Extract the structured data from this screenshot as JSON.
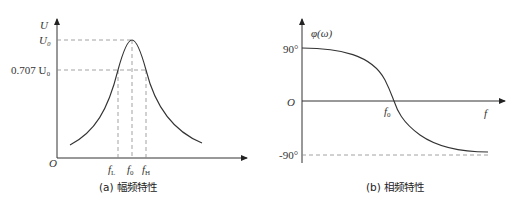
{
  "figure": {
    "panel_a": {
      "caption": "(a) 幅频特性",
      "y_axis_label": "U",
      "origin_label": "O",
      "y_ticks": {
        "peak": "U₀",
        "half_power": "0.707 U₀"
      },
      "x_ticks": {
        "low": "fL",
        "low_sub": "L",
        "center": "f0",
        "center_sub": "0",
        "high": "fH",
        "high_sub": "H",
        "f": "f"
      },
      "curve": "resonance bell curve peaking at f0"
    },
    "panel_b": {
      "caption": "(b) 相频特性",
      "y_axis_label": "φ(ω)",
      "origin_label": "O",
      "x_axis_label": "f",
      "y_ticks": {
        "top": "90°",
        "bottom": "-90°"
      },
      "x_ticks": {
        "center": "f",
        "center_sub": "0"
      },
      "curve": "phase decreasing from +90° to -90°, crossing 0 at f0"
    },
    "colors": {
      "line": "#333333",
      "dashed": "#8a8a8a"
    }
  }
}
